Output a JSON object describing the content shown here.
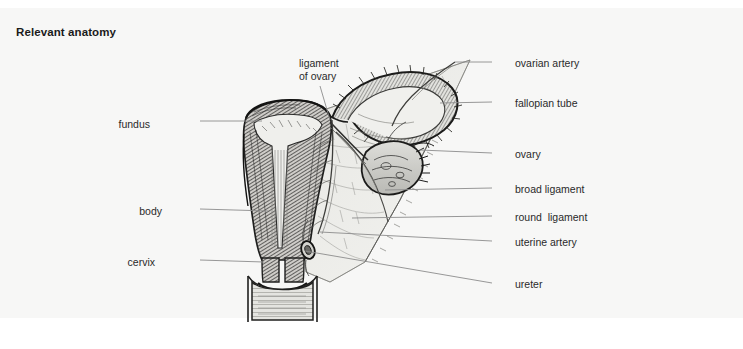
{
  "page": {
    "title": "Relevant anatomy",
    "background_color": "#ffffff",
    "panel_color": "#f7f7f6",
    "text_color": "#2a2a2a",
    "title_color": "#1b1b1b",
    "leader_line_color": "#8c8c8c",
    "ink_color": "#2b2b2b"
  },
  "figure": {
    "type": "anatomical-illustration",
    "style": "pencil line drawing with hatched shading"
  },
  "labels": {
    "left": [
      {
        "id": "fundus",
        "text": "fundus",
        "x": 150,
        "y": 118,
        "line_x1": 200,
        "line_x2": 262,
        "line_y1": 121,
        "line_y2": 121
      },
      {
        "id": "body",
        "text": "body",
        "x": 162,
        "y": 205,
        "line_x1": 200,
        "line_x2": 268,
        "line_y1": 209,
        "line_y2": 211
      },
      {
        "id": "cervix",
        "text": "cervix",
        "x": 155,
        "y": 256,
        "line_x1": 200,
        "line_x2": 264,
        "line_y1": 260,
        "line_y2": 262
      }
    ],
    "top": [
      {
        "id": "ligament-of-ovary",
        "text": "ligament\nof ovary",
        "x": 299,
        "y": 57,
        "line_x1": 320,
        "line_x2": 330,
        "line_y1": 86,
        "line_y2": 120
      }
    ],
    "right": [
      {
        "id": "ovarian-artery",
        "text": "ovarian artery",
        "x": 515,
        "y": 57,
        "line_x1": 492,
        "line_x2": 455,
        "line_y1": 62,
        "line_y2": 62
      },
      {
        "id": "fallopian-tube",
        "text": "fallopian tube",
        "x": 515,
        "y": 97,
        "line_x1": 492,
        "line_x2": 440,
        "line_y1": 102,
        "line_y2": 103
      },
      {
        "id": "ovary",
        "text": "ovary",
        "x": 515,
        "y": 148,
        "line_x1": 492,
        "line_x2": 420,
        "line_y1": 153,
        "line_y2": 150
      },
      {
        "id": "broad-ligament",
        "text": "broad ligament",
        "x": 515,
        "y": 183,
        "line_x1": 492,
        "line_x2": 385,
        "line_y1": 188,
        "line_y2": 190
      },
      {
        "id": "round-ligament",
        "text": "round  ligament",
        "x": 515,
        "y": 211,
        "line_x1": 492,
        "line_x2": 352,
        "line_y1": 216,
        "line_y2": 218
      },
      {
        "id": "uterine-artery",
        "text": "uterine artery",
        "x": 515,
        "y": 236,
        "line_x1": 492,
        "line_x2": 320,
        "line_y1": 241,
        "line_y2": 232
      },
      {
        "id": "ureter",
        "text": "ureter",
        "x": 515,
        "y": 278,
        "line_x1": 492,
        "line_x2": 305,
        "line_y1": 283,
        "line_y2": 251
      }
    ]
  }
}
